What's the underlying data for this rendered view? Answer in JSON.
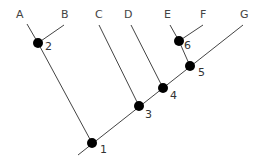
{
  "diagram": {
    "type": "cladogram",
    "colors": {
      "line": "#444444",
      "node": "#000000",
      "text": "#444444"
    },
    "taxa": [
      {
        "id": "A",
        "label": "A",
        "x": 20,
        "y": 18,
        "tip": [
          27,
          24
        ]
      },
      {
        "id": "B",
        "label": "B",
        "x": 65,
        "y": 18,
        "tip": [
          64,
          25
        ]
      },
      {
        "id": "C",
        "label": "C",
        "x": 98,
        "y": 18,
        "tip": [
          99,
          25
        ]
      },
      {
        "id": "D",
        "label": "D",
        "x": 128,
        "y": 18,
        "tip": [
          131,
          25
        ]
      },
      {
        "id": "E",
        "label": "E",
        "x": 167,
        "y": 18,
        "tip": [
          170,
          25
        ]
      },
      {
        "id": "F",
        "label": "F",
        "x": 203,
        "y": 18,
        "tip": [
          203,
          25
        ]
      },
      {
        "id": "G",
        "label": "G",
        "x": 244,
        "y": 18,
        "tip": [
          243,
          25
        ]
      }
    ],
    "nodes": [
      {
        "id": "1",
        "label": "1",
        "cx": 92,
        "cy": 143
      },
      {
        "id": "2",
        "label": "2",
        "cx": 38,
        "cy": 43
      },
      {
        "id": "3",
        "label": "3",
        "cx": 139,
        "cy": 106
      },
      {
        "id": "4",
        "label": "4",
        "cx": 163,
        "cy": 88
      },
      {
        "id": "5",
        "label": "5",
        "cx": 190,
        "cy": 66
      },
      {
        "id": "6",
        "label": "6",
        "cx": 179,
        "cy": 41
      }
    ],
    "root": [
      78,
      155
    ]
  }
}
